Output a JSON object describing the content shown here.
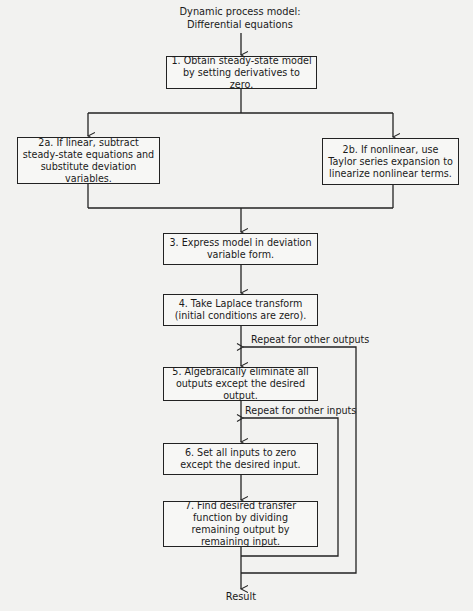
{
  "diagram": {
    "title_lines": [
      "Dynamic process model:",
      "Differential equations"
    ],
    "steps": [
      {
        "id": "1",
        "text": "1. Obtain steady-state model by setting derivatives to zero."
      },
      {
        "id": "2a",
        "text": "2a. If linear, subtract steady-state equations and substitute deviation variables."
      },
      {
        "id": "2b",
        "text": "2b. If nonlinear, use Taylor series expansion to linearize nonlinear terms."
      },
      {
        "id": "3",
        "text": "3. Express model in deviation variable form."
      },
      {
        "id": "4",
        "text": "4. Take Laplace transform (initial conditions are zero)."
      },
      {
        "id": "5",
        "text": "5. Algebraically eliminate all outputs except the desired output."
      },
      {
        "id": "6",
        "text": "6. Set all inputs to zero except the desired input."
      },
      {
        "id": "7",
        "text": "7. Find desired transfer function by dividing remaining output by remaining input."
      }
    ],
    "loop_labels": {
      "outputs": "Repeat for other outputs",
      "inputs": "Repeat for other inputs"
    },
    "result": "Result",
    "colors": {
      "line": "#222222",
      "background": "#f2f2f0"
    }
  }
}
